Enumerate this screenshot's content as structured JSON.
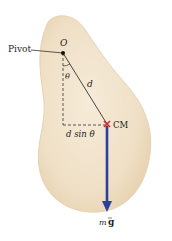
{
  "diagram": {
    "type": "physical-pendulum",
    "labels": {
      "pivot": "Pivot",
      "origin": "O",
      "angle": "θ",
      "distance": "d",
      "lever_arm": "d sin θ",
      "center_of_mass": "CM",
      "force_m": "m",
      "force_g": "g"
    },
    "colors": {
      "body_fill": "#efe0c8",
      "body_edge": "#e2cfae",
      "force_arrow": "#2b3f9e",
      "cm_marker": "#d9262b",
      "lines": "#333333"
    }
  }
}
